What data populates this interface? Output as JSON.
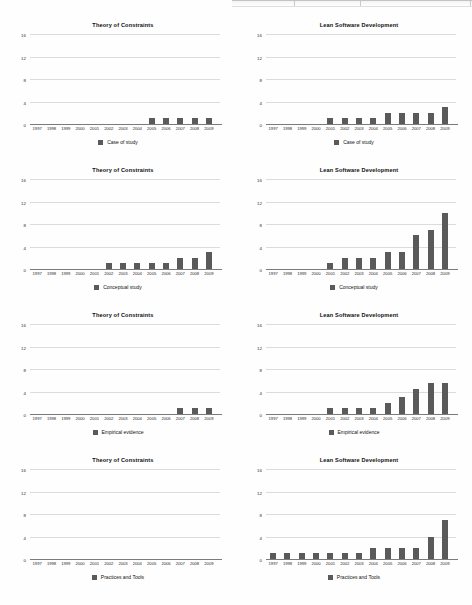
{
  "page": {
    "background": "#fefefe",
    "bar_color": "#5a5a5a",
    "gridline_color": "#dcdcdc",
    "axis_color": "#7b7b7b"
  },
  "axis": {
    "yticks": [
      "0",
      "4",
      "8",
      "12",
      "16"
    ],
    "ylim": [
      0,
      16
    ],
    "years": [
      "1997",
      "1998",
      "1999",
      "2000",
      "2001",
      "2002",
      "2003",
      "2004",
      "2005",
      "2006",
      "2007",
      "2008",
      "2009"
    ]
  },
  "chart_data": [
    {
      "type": "bar",
      "title": "Theory of Constraints",
      "legend": "Case of study",
      "xlabel": "",
      "ylabel": "",
      "ylim": [
        0,
        16
      ],
      "yticks": [
        0,
        4,
        8,
        12,
        16
      ],
      "grid": true,
      "legend_position": "bottom",
      "categories": [
        "1997",
        "1998",
        "1999",
        "2000",
        "2001",
        "2002",
        "2003",
        "2004",
        "2005",
        "2006",
        "2007",
        "2008",
        "2009"
      ],
      "values": [
        0,
        0,
        0,
        0,
        0,
        0,
        0,
        0,
        1,
        1,
        1,
        1,
        1
      ]
    },
    {
      "type": "bar",
      "title": "Lean Software Development",
      "legend": "Case of study",
      "xlabel": "",
      "ylabel": "",
      "ylim": [
        0,
        16
      ],
      "yticks": [
        0,
        4,
        8,
        12,
        16
      ],
      "grid": true,
      "legend_position": "bottom",
      "categories": [
        "1997",
        "1998",
        "1999",
        "2000",
        "2001",
        "2002",
        "2003",
        "2004",
        "2005",
        "2006",
        "2007",
        "2008",
        "2009"
      ],
      "values": [
        0,
        0,
        0,
        0,
        1,
        1,
        1,
        1,
        2,
        2,
        2,
        2,
        3
      ]
    },
    {
      "type": "bar",
      "title": "Theory of Constraints",
      "legend": "Conceptual study",
      "xlabel": "",
      "ylabel": "",
      "ylim": [
        0,
        16
      ],
      "yticks": [
        0,
        4,
        8,
        12,
        16
      ],
      "grid": true,
      "legend_position": "bottom",
      "categories": [
        "1997",
        "1998",
        "1999",
        "2000",
        "2001",
        "2002",
        "2003",
        "2004",
        "2005",
        "2006",
        "2007",
        "2008",
        "2009"
      ],
      "values": [
        0,
        0,
        0,
        0,
        0,
        1,
        1,
        1,
        1,
        1,
        2,
        2,
        3
      ]
    },
    {
      "type": "bar",
      "title": "Lean Software Development",
      "legend": "Conceptual study",
      "xlabel": "",
      "ylabel": "",
      "ylim": [
        0,
        16
      ],
      "yticks": [
        0,
        4,
        8,
        12,
        16
      ],
      "grid": true,
      "legend_position": "bottom",
      "categories": [
        "1997",
        "1998",
        "1999",
        "2000",
        "2001",
        "2002",
        "2003",
        "2004",
        "2005",
        "2006",
        "2007",
        "2008",
        "2009"
      ],
      "values": [
        0,
        0,
        0,
        0,
        1,
        2,
        2,
        2,
        3,
        3,
        6,
        7,
        10
      ]
    },
    {
      "type": "bar",
      "title": "Theory of Constraints",
      "legend": "Empirical evidence",
      "xlabel": "",
      "ylabel": "",
      "ylim": [
        0,
        16
      ],
      "yticks": [
        0,
        4,
        8,
        12,
        16
      ],
      "grid": true,
      "legend_position": "bottom",
      "categories": [
        "1997",
        "1998",
        "1999",
        "2000",
        "2001",
        "2002",
        "2003",
        "2004",
        "2005",
        "2006",
        "2007",
        "2008",
        "2009"
      ],
      "values": [
        0,
        0,
        0,
        0,
        0,
        0,
        0,
        0,
        0,
        0,
        1,
        1,
        1
      ]
    },
    {
      "type": "bar",
      "title": "Lean Software Development",
      "legend": "Empirical evidence",
      "xlabel": "",
      "ylabel": "",
      "ylim": [
        0,
        16
      ],
      "yticks": [
        0,
        4,
        8,
        12,
        16
      ],
      "grid": true,
      "legend_position": "bottom",
      "categories": [
        "1997",
        "1998",
        "1999",
        "2000",
        "2001",
        "2002",
        "2003",
        "2004",
        "2005",
        "2006",
        "2007",
        "2008",
        "2009"
      ],
      "values": [
        0,
        0,
        0,
        0,
        1,
        1,
        1,
        1,
        2,
        3,
        4.5,
        5.5,
        5.5
      ]
    },
    {
      "type": "bar",
      "title": "Theory of Constraints",
      "legend": "Practices and Tools",
      "xlabel": "",
      "ylabel": "",
      "ylim": [
        0,
        16
      ],
      "yticks": [
        0,
        4,
        8,
        12,
        16
      ],
      "grid": true,
      "legend_position": "bottom",
      "categories": [
        "1997",
        "1998",
        "1999",
        "2000",
        "2001",
        "2002",
        "2003",
        "2004",
        "2005",
        "2006",
        "2007",
        "2008",
        "2009"
      ],
      "values": [
        0,
        0,
        0,
        0,
        0,
        0,
        0,
        0,
        0,
        0,
        0,
        0,
        0
      ]
    },
    {
      "type": "bar",
      "title": "Lean Software Development",
      "legend": "Practices and Tools",
      "xlabel": "",
      "ylabel": "",
      "ylim": [
        0,
        16
      ],
      "yticks": [
        0,
        4,
        8,
        12,
        16
      ],
      "grid": true,
      "legend_position": "bottom",
      "categories": [
        "1997",
        "1998",
        "1999",
        "2000",
        "2001",
        "2002",
        "2003",
        "2004",
        "2005",
        "2006",
        "2007",
        "2008",
        "2009"
      ],
      "values": [
        1,
        1,
        1,
        1,
        1,
        1,
        1,
        2,
        2,
        2,
        2,
        4,
        7
      ]
    }
  ]
}
